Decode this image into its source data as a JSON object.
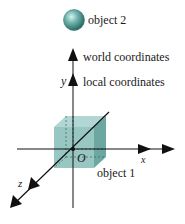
{
  "diagram": {
    "labels": {
      "object2": "object 2",
      "world": "world coordinates",
      "local": "local coordinates",
      "y_axis": "y",
      "x_axis": "x",
      "z_axis": "z",
      "origin": "O",
      "object1": "object 1"
    },
    "colors": {
      "cube_front": "#8fc1bd",
      "cube_top": "#a9d2ce",
      "cube_side": "#5f9f9a",
      "sphere_light": "#cfeeea",
      "sphere_mid": "#5fa7a1",
      "sphere_dark": "#2f6f6a",
      "axis": "#111111"
    }
  }
}
